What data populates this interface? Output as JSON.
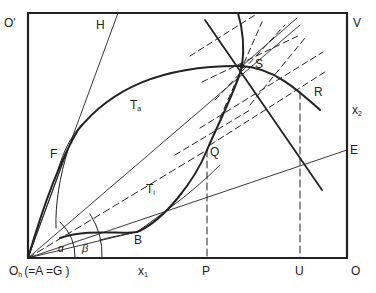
{
  "diagram": {
    "type": "edgeworth-box-geometry",
    "labels": {
      "origin_bottom_left": "O",
      "origin_bottom_left_sub": "h",
      "origin_bottom_left_note": "(=A =G )",
      "origin_top_left": "O'",
      "top_right": "V",
      "bottom_right": "O",
      "point_H": "H",
      "point_F": "F",
      "point_B": "B",
      "point_Q": "Q",
      "point_S": "S",
      "point_R": "R",
      "point_E": "E",
      "point_P": "P",
      "point_U": "U",
      "curve_Ta": "T",
      "curve_Ta_sub": "a",
      "curve_Ti": "T",
      "curve_Ti_sub": "i",
      "axis_x1": "x",
      "axis_x1_sub": "1",
      "axis_x2": "x",
      "axis_x2_sub": "2",
      "angle_alpha": "α",
      "angle_beta": "β"
    },
    "colors": {
      "ink": "#222222",
      "background": "#ffffff"
    }
  }
}
